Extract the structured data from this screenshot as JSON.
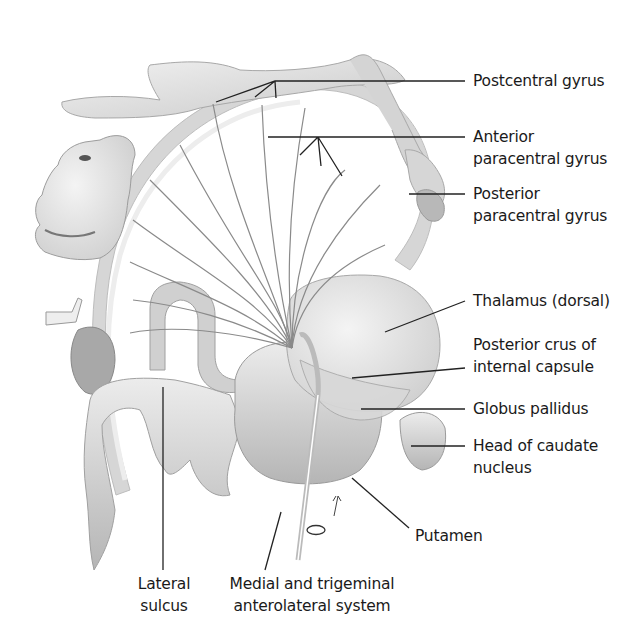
{
  "figure": {
    "colors": {
      "background": "#ffffff",
      "text": "#1a1a1a",
      "leader_line": "#222222",
      "tissue": "#dcdcdc",
      "tract": "#8a8a8a"
    }
  },
  "labels": {
    "postcentral_gyrus": {
      "lines": [
        "Postcentral gyrus"
      ]
    },
    "anterior_paracentral_gyrus": {
      "lines": [
        "Anterior",
        "paracentral gyrus"
      ]
    },
    "posterior_paracentral_gyrus": {
      "lines": [
        "Posterior",
        "paracentral gyrus"
      ]
    },
    "thalamus": {
      "lines": [
        "Thalamus (dorsal)"
      ]
    },
    "posterior_crus": {
      "lines": [
        "Posterior crus of",
        "internal capsule"
      ]
    },
    "globus_pallidus": {
      "lines": [
        "Globus pallidus"
      ]
    },
    "head_caudate": {
      "lines": [
        "Head of caudate",
        "nucleus"
      ]
    },
    "putamen": {
      "lines": [
        "Putamen"
      ]
    },
    "lateral_sulcus": {
      "lines": [
        "Lateral",
        "sulcus"
      ]
    },
    "medial_trigeminal": {
      "lines": [
        "Medial and trigeminal",
        "anterolateral system"
      ]
    }
  }
}
